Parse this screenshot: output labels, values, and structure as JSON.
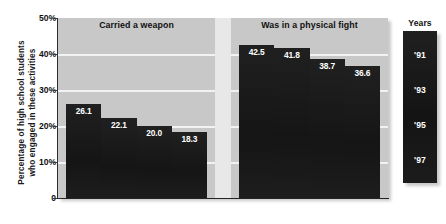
{
  "chart_data": {
    "type": "bar",
    "title": "",
    "xlabel": "",
    "ylabel": "Percentage of high school students who engaged in these activities",
    "ylim": [
      0,
      50
    ],
    "grid": true,
    "legend_position": "right",
    "legend_title": "Years",
    "categories": [
      "Carried a weapon",
      "Was in a physical fight"
    ],
    "series": [
      {
        "name": "'91",
        "values": [
          26.1,
          42.5
        ]
      },
      {
        "name": "'93",
        "values": [
          22.1,
          41.8
        ]
      },
      {
        "name": "'95",
        "values": [
          20.0,
          38.7
        ]
      },
      {
        "name": "'97",
        "values": [
          18.3,
          36.6
        ]
      }
    ],
    "ytick_labels": [
      "50%",
      "40%",
      "30%",
      "20%",
      "10%",
      "0"
    ],
    "ytick_values": [
      50,
      40,
      30,
      20,
      10,
      0
    ],
    "value_label_format": "one-decimal",
    "bar_color": "#1b1b1b",
    "plot_background": "#c8c8c8",
    "gridline_color": "#f2f2f2",
    "value_label_color": "#ffffff"
  },
  "axis": {
    "y_title_line1": "Percentage of high school students",
    "y_title_line2": "who engaged in these activities",
    "ticks": [
      {
        "label": "50%",
        "value": 50
      },
      {
        "label": "40%",
        "value": 40
      },
      {
        "label": "30%",
        "value": 30
      },
      {
        "label": "20%",
        "value": 20
      },
      {
        "label": "10%",
        "value": 10
      },
      {
        "label": "0",
        "value": 0
      }
    ]
  },
  "panels": [
    {
      "title": "Carried a weapon",
      "bars": [
        {
          "year": "'91",
          "value": 26.1,
          "label": "26.1"
        },
        {
          "year": "'93",
          "value": 22.1,
          "label": "22.1"
        },
        {
          "year": "'95",
          "value": 20.0,
          "label": "20.0"
        },
        {
          "year": "'97",
          "value": 18.3,
          "label": "18.3"
        }
      ]
    },
    {
      "title": "Was in a physical fight",
      "bars": [
        {
          "year": "'91",
          "value": 42.5,
          "label": "42.5"
        },
        {
          "year": "'93",
          "value": 41.8,
          "label": "41.8"
        },
        {
          "year": "'95",
          "value": 38.7,
          "label": "38.7"
        },
        {
          "year": "'97",
          "value": 36.6,
          "label": "36.6"
        }
      ]
    }
  ],
  "legend": {
    "title": "Years",
    "items": [
      {
        "label": "'91"
      },
      {
        "label": "'93"
      },
      {
        "label": "'95"
      },
      {
        "label": "'97"
      }
    ]
  }
}
